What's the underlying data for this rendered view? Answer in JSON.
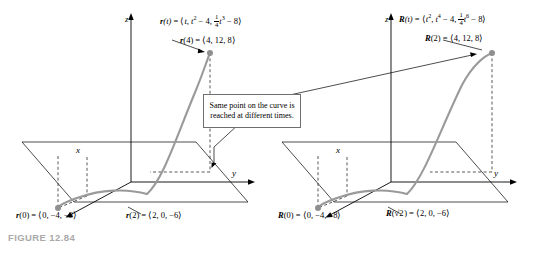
{
  "figure": {
    "caption": "FIGURE 12.84",
    "callout_text": "Same point on the curve is reached at different times."
  },
  "colors": {
    "curve": "#9a9a9a",
    "axis": "#000000",
    "dashed": "#3a3a3a",
    "callout_border": "#6f6f6f",
    "caption": "#a9a9a9",
    "point": "#8f8f8f"
  },
  "left_panel": {
    "axes": {
      "x": "x",
      "y": "y",
      "z": "z"
    },
    "labels": [
      {
        "name": "r-definition",
        "text": "r(t) = ⟨t, t² − 4, ¼t³ − 8⟩"
      },
      {
        "name": "r-of-4",
        "text": "r(4) = ⟨4, 12, 8⟩"
      },
      {
        "name": "r-of-0",
        "text": "r(0) = ⟨0, −4, −8⟩"
      },
      {
        "name": "r-of-2",
        "text": "r(2) = ⟨2, 0, −6⟩"
      }
    ]
  },
  "right_panel": {
    "axes": {
      "x": "x",
      "y": "y",
      "z": "z"
    },
    "labels": [
      {
        "name": "R-definition",
        "text": "R(t) = ⟨t², t⁴ − 4, ¼t⁶ − 8⟩"
      },
      {
        "name": "R-of-2",
        "text": "R(2) = ⟨4, 12, 8⟩"
      },
      {
        "name": "R-of-0",
        "text": "R(0) = ⟨0, −4, −8⟩"
      },
      {
        "name": "R-of-sqrt2",
        "text": "R(√2) = ⟨2, 0, −6⟩"
      }
    ]
  }
}
